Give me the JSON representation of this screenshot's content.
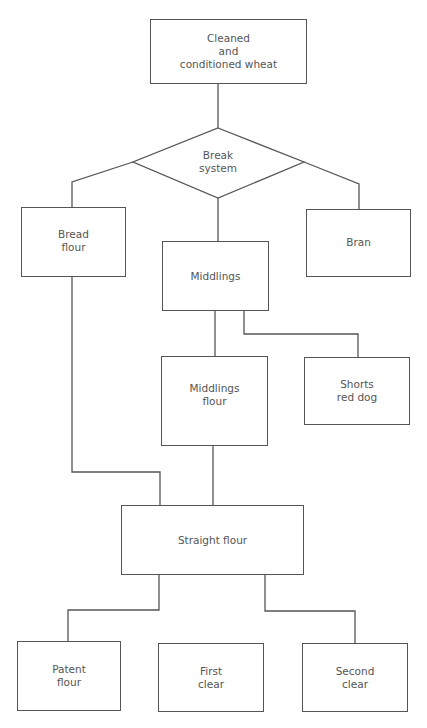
{
  "diagram": {
    "type": "flowchart",
    "stroke_color": "#555555",
    "text_color": "#555555",
    "nodes": {
      "start": {
        "label": "Cleaned\nand\nconditioned wheat",
        "shape": "rectangle"
      },
      "break": {
        "label": "Break\nsystem",
        "shape": "diamond"
      },
      "bread_flour": {
        "label": "Bread\nflour",
        "shape": "rectangle"
      },
      "middlings": {
        "label": "Middlings",
        "shape": "rectangle"
      },
      "bran": {
        "label": "Bran",
        "shape": "rectangle"
      },
      "middlings_flour": {
        "label": "Middlings\nflour",
        "shape": "rectangle"
      },
      "shorts": {
        "label": "Shorts\nred dog",
        "shape": "rectangle"
      },
      "straight_flour": {
        "label": "Straight flour",
        "shape": "rectangle"
      },
      "patent_flour": {
        "label": "Patent\nflour",
        "shape": "rectangle"
      },
      "first_clear": {
        "label": "First\nclear",
        "shape": "rectangle"
      },
      "second_clear": {
        "label": "Second\nclear",
        "shape": "rectangle"
      }
    },
    "edges": [
      [
        "Cleaned and conditioned wheat",
        "Break system"
      ],
      [
        "Break system",
        "Bread flour"
      ],
      [
        "Break system",
        "Middlings"
      ],
      [
        "Break system",
        "Bran"
      ],
      [
        "Middlings",
        "Middlings flour"
      ],
      [
        "Middlings",
        "Shorts red dog"
      ],
      [
        "Bread flour",
        "Straight flour"
      ],
      [
        "Middlings flour",
        "Straight flour"
      ],
      [
        "Straight flour",
        "Patent flour"
      ],
      [
        "Straight flour",
        "Second clear"
      ]
    ]
  }
}
